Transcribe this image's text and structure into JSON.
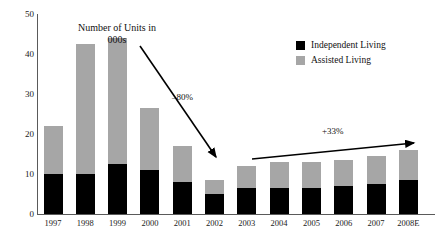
{
  "chart_data": {
    "type": "bar",
    "stacked": true,
    "title": "Number of Units in\n000s",
    "title_line1": "Number of Units in",
    "title_line2": "000s",
    "xlabel": "",
    "ylabel": "",
    "ylim": [
      0,
      50
    ],
    "yticks": [
      0,
      10,
      20,
      30,
      40,
      50
    ],
    "grid": false,
    "legend_position": "top-right",
    "categories": [
      "1997",
      "1998",
      "1999",
      "2000",
      "2001",
      "2002",
      "2003",
      "2004",
      "2005",
      "2006",
      "2007",
      "2008E"
    ],
    "series": [
      {
        "name": "Independent Living",
        "color": "#000000",
        "values": [
          10,
          10,
          12.5,
          11,
          8,
          5,
          6.5,
          6.5,
          6.5,
          7,
          7.5,
          8.5
        ]
      },
      {
        "name": "Assisted Living",
        "color": "#A6A6A6",
        "values": [
          12,
          32.5,
          31.5,
          15.5,
          9,
          3.5,
          5.5,
          6.5,
          6.5,
          6.5,
          7,
          7.5
        ]
      }
    ],
    "totals": [
      22,
      42.5,
      44,
      26.5,
      17,
      8.5,
      12,
      13,
      13,
      13.5,
      14.5,
      16
    ],
    "annotations": [
      {
        "name": "decline-arrow",
        "text": "–80%",
        "type": "arrow",
        "from": [
          140,
          46
        ],
        "to": [
          219,
          161
        ]
      },
      {
        "name": "growth-arrow",
        "text": "+33%",
        "type": "arrow",
        "from": [
          252,
          159
        ],
        "to": [
          418,
          142
        ]
      }
    ]
  },
  "axis": {
    "y_tick_labels": [
      "50",
      "40",
      "30",
      "20",
      "10",
      "0"
    ],
    "x_tick_labels": [
      "1997",
      "1998",
      "1999",
      "2000",
      "2001",
      "2002",
      "2003",
      "2004",
      "2005",
      "2006",
      "2007",
      "2008E"
    ]
  },
  "legend": {
    "items": [
      {
        "label": "Independent Living",
        "color": "#000000"
      },
      {
        "label": "Assisted Living",
        "color": "#A6A6A6"
      }
    ]
  },
  "title": {
    "line1": "Number of Units in",
    "line2": "000s"
  },
  "annotations": {
    "decline": "–80%",
    "growth": "+33%"
  }
}
